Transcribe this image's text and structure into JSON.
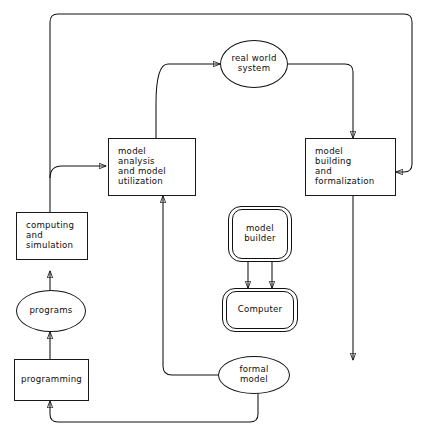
{
  "diagram": {
    "canvas": {
      "width": 432,
      "height": 437,
      "background": "#ffffff"
    },
    "stroke_color": "#111111",
    "nodes": {
      "real_world_system": {
        "label": "real world\nsystem",
        "shape": "ellipse"
      },
      "model_analysis": {
        "label": "model\nanalysis\nand  model\nutilization",
        "shape": "rectangle"
      },
      "model_building": {
        "label": "model\nbuilding\nand\nformalization",
        "shape": "rectangle"
      },
      "model_builder": {
        "label": "model\nbuilder",
        "shape": "double-rounded-rectangle"
      },
      "computer": {
        "label": "Computer",
        "shape": "double-rounded-rectangle"
      },
      "computing_simulation": {
        "label": "computing\nand\nsimulation",
        "shape": "rectangle"
      },
      "programs": {
        "label": "programs",
        "shape": "ellipse"
      },
      "programming": {
        "label": "programming",
        "shape": "rectangle"
      },
      "formal_model": {
        "label": "formal\nmodel",
        "shape": "ellipse"
      }
    },
    "edges": [
      {
        "from": "real_world_system",
        "to": "model_building",
        "arrow": "single"
      },
      {
        "from": "model_building",
        "to": "formal_model",
        "arrow": "single"
      },
      {
        "from": "formal_model",
        "to": "model_analysis",
        "arrow": "single"
      },
      {
        "from": "formal_model",
        "to": "programming",
        "arrow": "single"
      },
      {
        "from": "programming",
        "to": "programs",
        "arrow": "single"
      },
      {
        "from": "programs",
        "to": "computing_simulation",
        "arrow": "single"
      },
      {
        "from": "computing_simulation",
        "to": "model_analysis",
        "arrow": "single"
      },
      {
        "from": "computing_simulation",
        "to": "real_world_system",
        "arrow": "single"
      },
      {
        "from": "computing_simulation",
        "to": "model_building",
        "arrow": "single"
      },
      {
        "from": "model_builder",
        "to": "computer",
        "arrow": "single"
      },
      {
        "from": "computer",
        "to": "model_builder",
        "arrow": "single"
      }
    ]
  }
}
